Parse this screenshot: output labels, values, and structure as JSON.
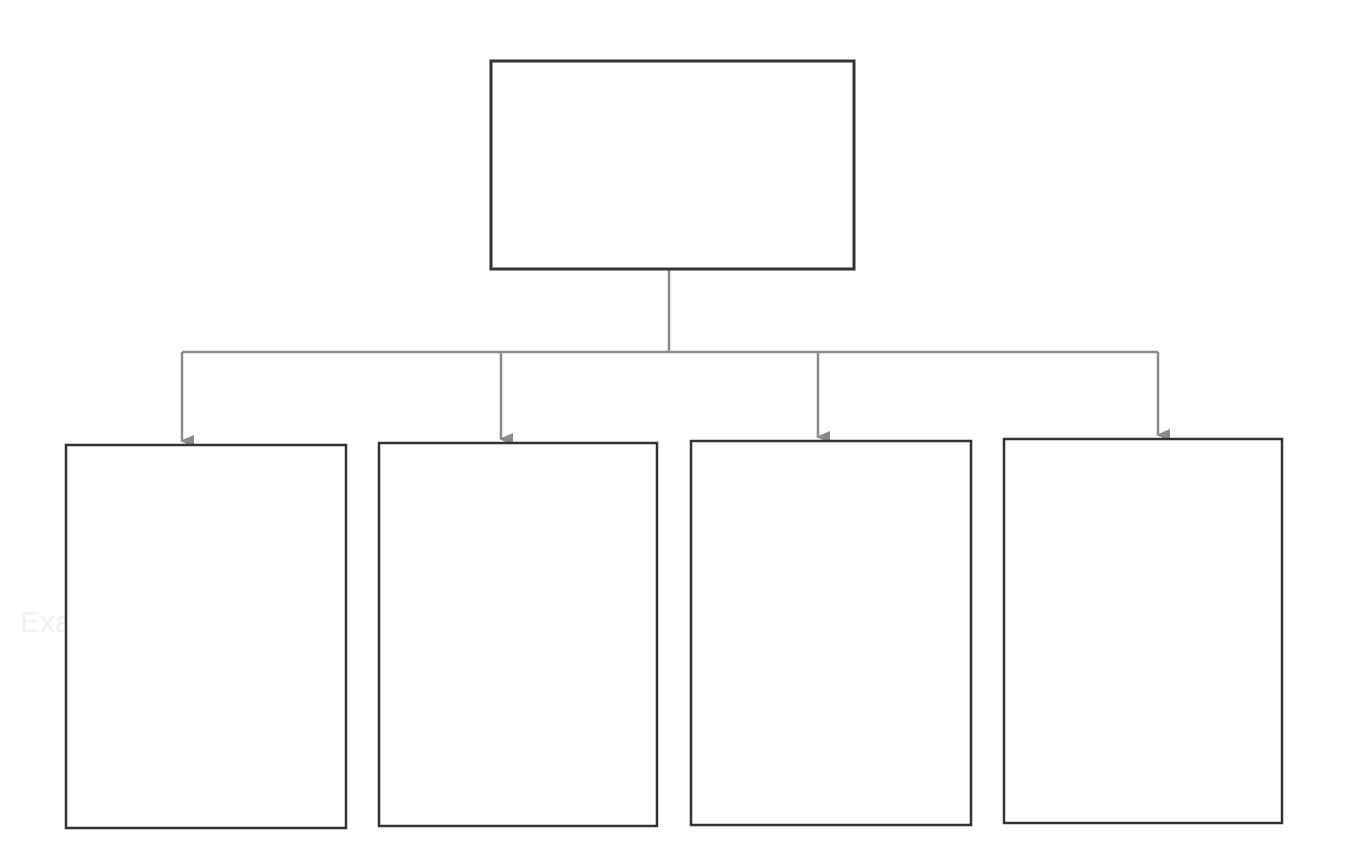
{
  "diagram": {
    "type": "hierarchy",
    "background": "#ffffff",
    "colors": {
      "box_stroke": "#333333",
      "connector": "#8a8a8a"
    },
    "root": {
      "id": "root",
      "label": "",
      "box": {
        "x": 491,
        "y": 61,
        "w": 363,
        "h": 208
      }
    },
    "trunk": {
      "x": 669,
      "y1": 269,
      "y2": 352
    },
    "bus": {
      "y": 352,
      "x1": 182,
      "x2": 1158
    },
    "children": [
      {
        "id": "child-1",
        "label": "",
        "arrow_x": 182,
        "box": {
          "x": 66,
          "y": 445,
          "w": 280,
          "h": 383
        }
      },
      {
        "id": "child-2",
        "label": "",
        "arrow_x": 501,
        "box": {
          "x": 379,
          "y": 443,
          "w": 278,
          "h": 383
        }
      },
      {
        "id": "child-3",
        "label": "",
        "arrow_x": 818,
        "box": {
          "x": 691,
          "y": 441,
          "w": 280,
          "h": 384
        }
      },
      {
        "id": "child-4",
        "label": "",
        "arrow_x": 1158,
        "box": {
          "x": 1004,
          "y": 439,
          "w": 278,
          "h": 384
        }
      }
    ]
  },
  "background_ghost_text": [
    {
      "text": "Example",
      "x": 1160,
      "y": 605
    },
    {
      "text": "Example",
      "x": 20,
      "y": 605
    }
  ]
}
